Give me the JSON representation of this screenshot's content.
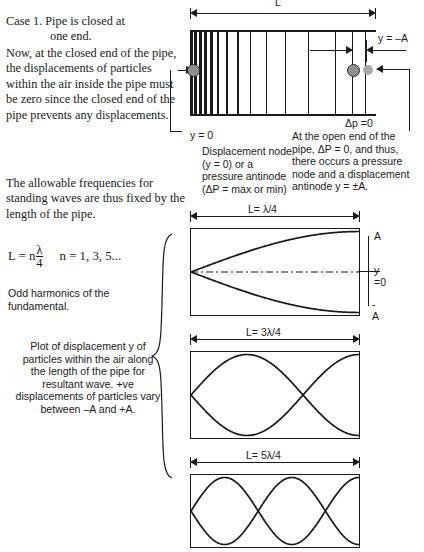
{
  "left_column": {
    "case_title_main": "Case 1.   Pipe is closed at",
    "case_title_cont": "one end.",
    "paragraph_closed_end": "Now, at the closed end of the pipe, the displacements of particles within the air inside the pipe must be zero since the closed end of the pipe prevents any displacements.",
    "paragraph_allowable": "The allowable frequencies for standing waves are thus fixed by the length of the pipe.",
    "formula": {
      "lhs": "L = n",
      "numerator": "λ",
      "denominator": "4",
      "n_values": "n = 1, 3, 5..."
    },
    "odd_harmonics_note": "Odd harmonics of the fundamental.",
    "plot_note": "Plot of displacement y of particles within the air along the length of the pipe for resultant wave. +ve displacements of particles vary between –A and +A."
  },
  "pipe_diagram": {
    "length_label": "L",
    "displacement_label": "y = –A",
    "pressure_label": "Δp =0",
    "node_label": "y = 0",
    "note_closed_end": "Displacement node (y = 0) or a pressure antinode (ΔP = max or min)",
    "note_open_end": "At the open end of the pipe, ΔP = 0, and thus, there occurs a pressure node and a displacement antinode y = ±A.",
    "line_positions": [
      0,
      4,
      9,
      14,
      20,
      27,
      36,
      47,
      60,
      76,
      95,
      118,
      145,
      175
    ]
  },
  "wave_plots": [
    {
      "length_label": "L= λ/4",
      "harmonic": 1,
      "axis_labels": {
        "top": "A",
        "middle": "y =0",
        "bottom": "-A"
      },
      "show_axis": true
    },
    {
      "length_label": "L= 3λ/4",
      "harmonic": 3,
      "axis_labels": {
        "top": "",
        "middle": "",
        "bottom": ""
      },
      "show_axis": false
    },
    {
      "length_label": "L= 5λ/4",
      "harmonic": 5,
      "axis_labels": {
        "top": "",
        "middle": "",
        "bottom": ""
      },
      "show_axis": false
    }
  ],
  "colors": {
    "ink": "#1a1a1a",
    "dot_fill": "#a9a9a9",
    "dot_edge": "#2b2b2b",
    "background": "#ffffff"
  }
}
